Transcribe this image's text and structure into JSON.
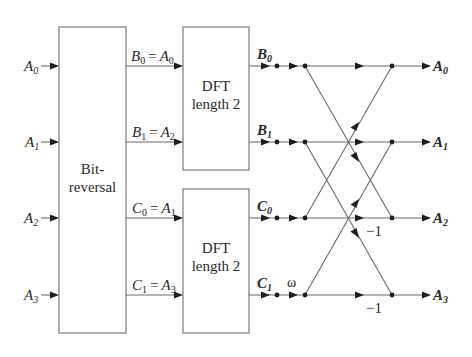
{
  "diagram": {
    "type": "radix-2 FFT flow graph (length 4, decimation in time)",
    "inputs": [
      {
        "base": "A",
        "sub": "0"
      },
      {
        "base": "A",
        "sub": "1"
      },
      {
        "base": "A",
        "sub": "2"
      },
      {
        "base": "A",
        "sub": "3"
      }
    ],
    "bitreversal": {
      "line1": "Bit-",
      "line2": "reversal"
    },
    "mapping_labels": [
      {
        "lhs_base": "B",
        "lhs_sub": "0",
        "eq": "=",
        "rhs_base": "A",
        "rhs_sub": "0"
      },
      {
        "lhs_base": "B",
        "lhs_sub": "1",
        "eq": "=",
        "rhs_base": "A",
        "rhs_sub": "2"
      },
      {
        "lhs_base": "C",
        "lhs_sub": "0",
        "eq": "=",
        "rhs_base": "A",
        "rhs_sub": "1"
      },
      {
        "lhs_base": "C",
        "lhs_sub": "1",
        "eq": "=",
        "rhs_base": "A",
        "rhs_sub": "3"
      }
    ],
    "dft_blocks": [
      {
        "line1": "DFT",
        "line2": "length 2"
      },
      {
        "line1": "DFT",
        "line2": "length 2"
      }
    ],
    "dft_outputs": [
      {
        "base": "B",
        "sub": "0"
      },
      {
        "base": "B",
        "sub": "1"
      },
      {
        "base": "C",
        "sub": "0"
      },
      {
        "base": "C",
        "sub": "1"
      }
    ],
    "twiddle_label": "ω",
    "butterfly_labels": [
      "−1",
      "−1"
    ],
    "outputs": [
      {
        "base": "A",
        "sub": "0"
      },
      {
        "base": "A",
        "sub": "1"
      },
      {
        "base": "A",
        "sub": "2"
      },
      {
        "base": "A",
        "sub": "3"
      }
    ],
    "colors": {
      "line": "#6a6a6a",
      "arrow": "#1e1e1e",
      "text": "#2a2a2a",
      "background": "#ffffff"
    }
  }
}
